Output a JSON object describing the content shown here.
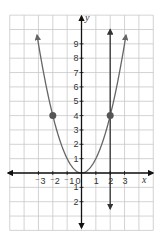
{
  "chart_data": {
    "type": "line",
    "title": "",
    "xlabel": "x",
    "ylabel": "y",
    "xlim": [
      -5,
      5
    ],
    "ylim": [
      -4,
      11
    ],
    "grid": true,
    "x_tick_labels": [
      "-3",
      "-2",
      "-1",
      "0",
      "1",
      "2",
      "3"
    ],
    "x_ticks": [
      -3,
      -2,
      -1,
      0,
      1,
      2,
      3
    ],
    "y_tick_labels": [
      "9",
      "8",
      "7",
      "6",
      "5",
      "4",
      "3",
      "2",
      "1",
      "1",
      "2"
    ],
    "y_ticks": [
      9,
      8,
      7,
      6,
      5,
      4,
      3,
      2,
      1,
      -1,
      -2
    ],
    "series": [
      {
        "name": "parabola y = x^2",
        "kind": "curve",
        "function": "x^2",
        "x_range": [
          -3.1,
          3.1
        ],
        "color": "#666666"
      },
      {
        "name": "vertical line x = 2",
        "kind": "vertical-line",
        "x": 2,
        "y_range": [
          -2.5,
          10
        ],
        "color": "#333333"
      }
    ],
    "points": [
      {
        "x": -2,
        "y": 4
      },
      {
        "x": 2,
        "y": 4
      }
    ]
  },
  "labels": {
    "x_axis": "x",
    "y_axis": "y",
    "origin": "0"
  },
  "colors": {
    "grid": "#c8c8c8",
    "axis": "#111111",
    "curve": "#666666",
    "vline": "#333333",
    "point": "#555555"
  }
}
